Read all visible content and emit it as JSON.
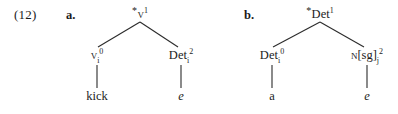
{
  "figure": {
    "example_number": "(12)",
    "background_color": "#ffffff",
    "line_color": "#2b2b2b",
    "text_color": "#1c1c1c"
  },
  "trees": [
    {
      "label": "a.",
      "root": {
        "star": "*",
        "category": "v",
        "small_caps": true,
        "subscript": "",
        "superscript": "1",
        "text": "*v1"
      },
      "left_daughter": {
        "star": "",
        "category": "v",
        "small_caps": true,
        "subscript": "i",
        "superscript": "0",
        "text": "vi0"
      },
      "right_daughter": {
        "star": "",
        "category": "Det",
        "small_caps": false,
        "subscript": "i",
        "superscript": "2",
        "text": "Deti2"
      },
      "left_terminal": {
        "text": "kick",
        "italic": false
      },
      "right_terminal": {
        "text": "e",
        "italic": true
      }
    },
    {
      "label": "b.",
      "root": {
        "star": "*",
        "category": "Det",
        "small_caps": false,
        "subscript": "",
        "superscript": "1",
        "text": "*Det1"
      },
      "left_daughter": {
        "star": "",
        "category": "Det",
        "small_caps": false,
        "subscript": "i",
        "superscript": "0",
        "text": "Deti0"
      },
      "right_daughter": {
        "star": "",
        "category": "N",
        "small_caps": true,
        "features": "[sg]",
        "subscript": "j",
        "superscript": "2",
        "text": "N[sg]j2"
      },
      "left_terminal": {
        "text": "a",
        "italic": false
      },
      "right_terminal": {
        "text": "e",
        "italic": true
      }
    }
  ]
}
